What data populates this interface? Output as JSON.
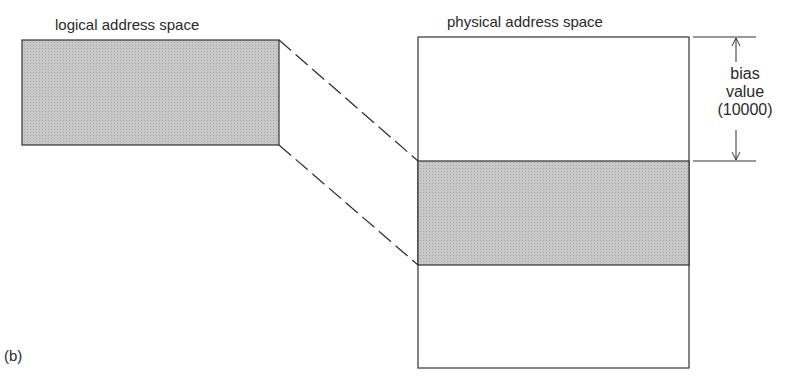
{
  "diagram": {
    "logical_label": "logical address space",
    "physical_label": "physical address space",
    "bias_line1": "bias",
    "bias_line2": "value",
    "bias_line3": "(10000)",
    "figure_label": "(b)",
    "colors": {
      "shade": "#c4c4c4",
      "stroke": "#333333"
    }
  }
}
